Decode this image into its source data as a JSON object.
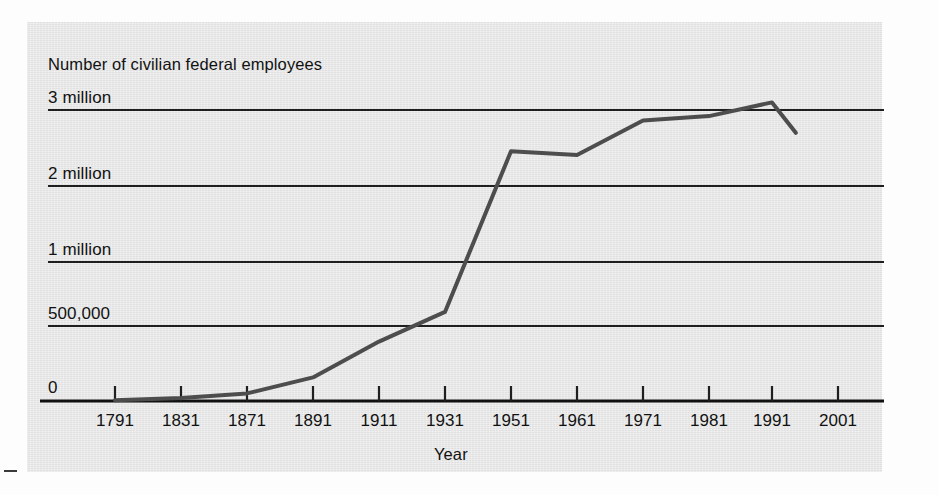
{
  "chart_data": {
    "type": "line",
    "title": "Number of civilian federal employees",
    "xlabel": "Year",
    "ylabel": "",
    "grid": true,
    "legend": false,
    "x": [
      1791,
      1831,
      1871,
      1891,
      1911,
      1931,
      1951,
      1961,
      1971,
      1981,
      1991,
      2001
    ],
    "categories": [
      "1791",
      "1831",
      "1871",
      "1891",
      "1911",
      "1931",
      "1951",
      "1961",
      "1971",
      "1981",
      "1991",
      "2001"
    ],
    "values": [
      5000,
      20000,
      51000,
      157000,
      396000,
      610000,
      2456000,
      2407000,
      2860000,
      2920000,
      3050000,
      2700000
    ],
    "series": [
      {
        "name": "Civilian federal employees",
        "values": [
          5000,
          20000,
          51000,
          157000,
          396000,
          610000,
          2456000,
          2407000,
          2860000,
          2920000,
          3050000,
          2700000
        ]
      }
    ],
    "ytick_labels": [
      "0",
      "500,000",
      "1 million",
      "2 million",
      "3 million"
    ],
    "ytick_values": [
      0,
      500000,
      1000000,
      2000000,
      3000000
    ],
    "ylim": [
      0,
      3200000
    ],
    "xlim": [
      1791,
      2001
    ],
    "note_last_point_partial": true,
    "line_color": "#4a4a4a",
    "axis_color": "#1a1a1a",
    "background_color": "#e6e6e6"
  },
  "chart": {
    "title": "Number of civilian federal employees",
    "x_axis_title": "Year",
    "y_labels": [
      {
        "text": "3 million",
        "value": 3000000
      },
      {
        "text": "2 million",
        "value": 2000000
      },
      {
        "text": "1 million",
        "value": 1000000
      },
      {
        "text": "500,000",
        "value": 500000
      },
      {
        "text": "0",
        "value": 0
      }
    ],
    "x_labels": [
      "1791",
      "1831",
      "1871",
      "1891",
      "1911",
      "1931",
      "1951",
      "1961",
      "1971",
      "1981",
      "1991",
      "2001"
    ]
  }
}
